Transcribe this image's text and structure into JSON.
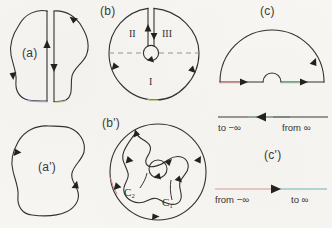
{
  "figure": {
    "background_color": "#f7f6f2",
    "ink_color": "#34322e",
    "panels": [
      {
        "id": "a",
        "label": "(a)",
        "description": "closed blob contour cut open by a vertical slit; arrow up on left side of slit, arrow down on right side"
      },
      {
        "id": "b",
        "label": "(b)",
        "description": "circle with a radial slit from top to a small circle at the centre; horizontal dashed diameter; regions I, II, III",
        "regions": [
          "II",
          "III",
          "I"
        ]
      },
      {
        "id": "c",
        "label": "(c)",
        "description": "large semicircular contour in the upper half plane indented by a small semicircle at the origin"
      },
      {
        "id": "a-prime",
        "label": "(a')",
        "description": "simple closed blob contour traversed counter-clockwise"
      },
      {
        "id": "b-prime",
        "label": "(b')",
        "description": "outer circle, irregular inner contour and a small circle at the centre",
        "curves": [
          {
            "name": "C₂"
          },
          {
            "name": "C₁"
          }
        ]
      },
      {
        "id": "c-prime",
        "label": "(c')",
        "description": "two horizontal real-axis lines with direction arrows"
      }
    ],
    "axis_lines": [
      {
        "id": "axis-c",
        "left_label": "to −∞",
        "right_label": "from ∞",
        "direction": "left",
        "left_color": "#6e6a62",
        "right_color": "#8fc49a"
      },
      {
        "id": "axis-c-prime",
        "left_label": "from −∞",
        "right_label": "to ∞",
        "direction": "right",
        "left_color": "#d89a9a",
        "right_color": "#6fb4bd"
      }
    ]
  }
}
